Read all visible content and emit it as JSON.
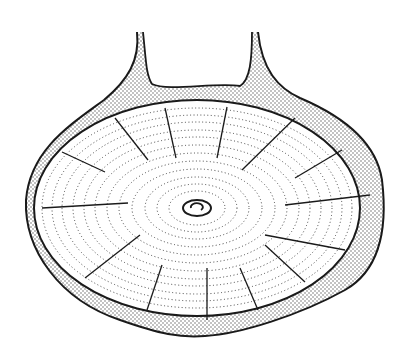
{
  "figure": {
    "width": 405,
    "height": 358,
    "background": "#ffffff",
    "ink_color": "#1a1a1a",
    "stipple_color": "#555555",
    "center": {
      "x": 197,
      "y": 208
    },
    "outer_shell_path": "M137,32 C140,60 128,80 104,100 C70,125 30,150 26,200 C24,250 60,300 120,320 C160,334 180,338 205,336 C240,334 300,315 345,290 C380,270 388,230 382,180 C376,140 340,115 300,98 C278,88 262,70 258,32",
    "inner_notch_path": "M143,32 C146,60 146,75 152,84 C168,92 215,82 240,86 C250,80 252,60 252,32",
    "inner_body": {
      "cx": 197,
      "cy": 208,
      "rx": 163,
      "ry": 108
    },
    "rings": [
      {
        "rx": 155,
        "ry": 100
      },
      {
        "rx": 145,
        "ry": 93
      },
      {
        "rx": 135,
        "ry": 86
      },
      {
        "rx": 124,
        "ry": 78
      },
      {
        "rx": 113,
        "ry": 71
      },
      {
        "rx": 102,
        "ry": 63
      },
      {
        "rx": 90,
        "ry": 55
      },
      {
        "rx": 78,
        "ry": 47
      },
      {
        "rx": 65,
        "ry": 39
      },
      {
        "rx": 52,
        "ry": 31
      },
      {
        "rx": 40,
        "ry": 24
      },
      {
        "rx": 28,
        "ry": 17
      }
    ],
    "center_mark": {
      "rx": 14,
      "ry": 8
    },
    "radial_lines": [
      {
        "x1": 115,
        "y1": 118,
        "x2": 148,
        "y2": 160
      },
      {
        "x1": 165,
        "y1": 108,
        "x2": 176,
        "y2": 158
      },
      {
        "x1": 227,
        "y1": 107,
        "x2": 217,
        "y2": 158
      },
      {
        "x1": 295,
        "y1": 118,
        "x2": 242,
        "y2": 170
      },
      {
        "x1": 342,
        "y1": 150,
        "x2": 295,
        "y2": 178
      },
      {
        "x1": 370,
        "y1": 195,
        "x2": 285,
        "y2": 205
      },
      {
        "x1": 62,
        "y1": 152,
        "x2": 105,
        "y2": 172
      },
      {
        "x1": 42,
        "y1": 208,
        "x2": 128,
        "y2": 203
      },
      {
        "x1": 85,
        "y1": 278,
        "x2": 140,
        "y2": 235
      },
      {
        "x1": 147,
        "y1": 310,
        "x2": 162,
        "y2": 265
      },
      {
        "x1": 207,
        "y1": 320,
        "x2": 207,
        "y2": 268
      },
      {
        "x1": 258,
        "y1": 310,
        "x2": 240,
        "y2": 268
      },
      {
        "x1": 305,
        "y1": 282,
        "x2": 265,
        "y2": 245
      },
      {
        "x1": 345,
        "y1": 250,
        "x2": 265,
        "y2": 235
      }
    ]
  }
}
